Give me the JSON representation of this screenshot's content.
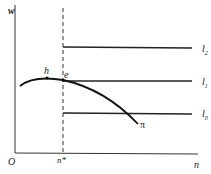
{
  "diagram": {
    "axes": {
      "y_label": "w",
      "x_label": "n",
      "origin_label": "O",
      "x_tick_label": "n*"
    },
    "lines": [
      {
        "name": "l2",
        "label": "l",
        "sub": "2"
      },
      {
        "name": "l1",
        "label": "l",
        "sub": "1"
      },
      {
        "name": "l0",
        "label": "l",
        "sub": "0"
      }
    ],
    "curve": {
      "label": "π"
    },
    "points": [
      {
        "label": "h"
      },
      {
        "label": "e"
      }
    ],
    "colors": {
      "stroke": "#222222",
      "background": "#ffffff"
    }
  }
}
